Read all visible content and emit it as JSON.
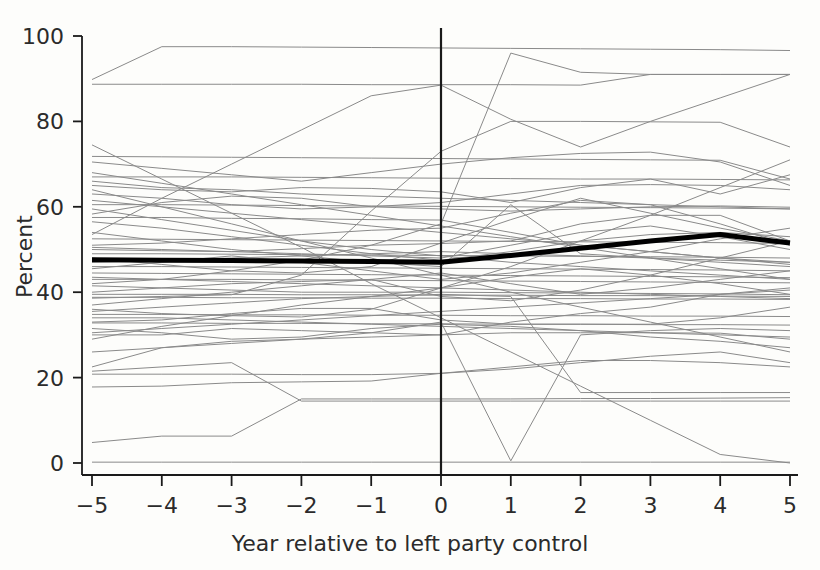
{
  "chart_data": {
    "type": "line",
    "title": "",
    "xlabel": "Year relative to left party control",
    "ylabel": "Percent",
    "xlim": [
      -5,
      5
    ],
    "ylim": [
      0,
      100
    ],
    "x": [
      -5,
      -4,
      -3,
      -2,
      -1,
      0,
      1,
      2,
      3,
      4,
      5
    ],
    "xticks": [
      -5,
      -4,
      -3,
      -2,
      -1,
      0,
      1,
      2,
      3,
      4,
      5
    ],
    "xtick_labels": [
      "−5",
      "−4",
      "−3",
      "−2",
      "−1",
      "0",
      "1",
      "2",
      "3",
      "4",
      "5"
    ],
    "yticks": [
      0,
      20,
      40,
      60,
      80,
      100
    ],
    "ytick_labels": [
      "0",
      "20",
      "40",
      "60",
      "80",
      "100"
    ],
    "grid": false,
    "legend": "none",
    "reference_line": {
      "orientation": "vertical",
      "x": 0,
      "label": "year of left party control",
      "color": "#1a1a1a"
    },
    "highlight_series": {
      "name": "Mean",
      "color": "#000000",
      "linewidth": 5,
      "values": [
        47.6,
        47.5,
        47.4,
        47.3,
        47.2,
        47.0,
        48.6,
        50.3,
        52.0,
        53.5,
        51.5
      ]
    },
    "series_color": "#8a8a8a",
    "series_linewidth": 1,
    "series": [
      {
        "name": "unit-01",
        "values": [
          89.8,
          97.5,
          97.5,
          97.4,
          97.3,
          97.2,
          97.1,
          97.0,
          96.9,
          96.8,
          96.6
        ]
      },
      {
        "name": "unit-02",
        "values": [
          88.7,
          88.7,
          88.7,
          88.7,
          88.6,
          88.6,
          88.6,
          88.5,
          91.0,
          91.0,
          91.0
        ]
      },
      {
        "name": "unit-03",
        "values": [
          53.5,
          62.0,
          70.0,
          78.0,
          86.0,
          88.5,
          80.5,
          74.0,
          80.0,
          85.5,
          91.0
        ]
      },
      {
        "name": "unit-04",
        "values": [
          38.6,
          39.0,
          39.4,
          44.0,
          59.0,
          73.0,
          80.0,
          80.0,
          79.9,
          79.8,
          74.0
        ]
      },
      {
        "name": "unit-05",
        "values": [
          71.8,
          71.7,
          71.6,
          71.5,
          71.4,
          71.3,
          71.2,
          71.1,
          71.0,
          70.9,
          66.5
        ]
      },
      {
        "name": "unit-06",
        "values": [
          70.5,
          69.0,
          67.5,
          66.0,
          68.0,
          70.0,
          71.5,
          72.5,
          72.8,
          70.5,
          65.0
        ]
      },
      {
        "name": "unit-07",
        "values": [
          67.0,
          67.0,
          67.0,
          66.9,
          66.8,
          66.7,
          66.6,
          66.5,
          66.5,
          66.4,
          66.3
        ]
      },
      {
        "name": "unit-08",
        "values": [
          65.0,
          64.0,
          63.5,
          64.5,
          64.3,
          63.5,
          61.0,
          64.5,
          66.5,
          63.0,
          67.5
        ]
      },
      {
        "name": "unit-09",
        "values": [
          63.0,
          62.0,
          60.5,
          59.5,
          60.0,
          61.0,
          63.0,
          65.0,
          65.2,
          65.0,
          64.0
        ]
      },
      {
        "name": "unit-10",
        "values": [
          60.5,
          60.5,
          60.4,
          60.3,
          60.2,
          60.1,
          60.0,
          59.9,
          59.8,
          59.7,
          59.5
        ]
      },
      {
        "name": "unit-11",
        "values": [
          58.3,
          61.0,
          62.5,
          62.0,
          60.0,
          59.5,
          59.0,
          59.5,
          60.0,
          60.2,
          59.9
        ]
      },
      {
        "name": "unit-12",
        "values": [
          52.5,
          52.4,
          52.3,
          52.2,
          52.1,
          52.0,
          51.9,
          51.8,
          51.7,
          51.6,
          51.4
        ]
      },
      {
        "name": "unit-13",
        "values": [
          50.0,
          49.7,
          49.5,
          50.2,
          51.0,
          51.4,
          52.0,
          56.0,
          58.0,
          58.0,
          52.0
        ]
      },
      {
        "name": "unit-14",
        "values": [
          49.0,
          49.0,
          48.9,
          48.8,
          48.7,
          48.6,
          48.5,
          48.4,
          48.3,
          48.2,
          48.0
        ]
      },
      {
        "name": "unit-15",
        "values": [
          46.0,
          46.0,
          45.9,
          45.8,
          45.7,
          45.6,
          45.5,
          45.4,
          45.3,
          45.2,
          45.0
        ]
      },
      {
        "name": "unit-16",
        "values": [
          44.5,
          44.4,
          44.3,
          44.2,
          44.1,
          44.0,
          43.9,
          43.8,
          43.7,
          43.6,
          43.4
        ]
      },
      {
        "name": "unit-17",
        "values": [
          43.0,
          43.0,
          43.0,
          42.9,
          42.8,
          42.7,
          42.6,
          42.5,
          42.4,
          42.3,
          42.2
        ]
      },
      {
        "name": "unit-18",
        "values": [
          41.5,
          41.0,
          40.5,
          40.0,
          40.0,
          40.0,
          39.9,
          39.8,
          39.7,
          39.6,
          39.4
        ]
      },
      {
        "name": "unit-19",
        "values": [
          39.5,
          39.5,
          39.5,
          39.4,
          39.4,
          39.3,
          39.3,
          39.2,
          39.2,
          39.1,
          39.0
        ]
      },
      {
        "name": "unit-20",
        "values": [
          38.8,
          38.8,
          38.7,
          38.7,
          38.6,
          38.6,
          38.5,
          38.5,
          38.4,
          38.4,
          38.3
        ]
      },
      {
        "name": "unit-21",
        "values": [
          34.8,
          34.8,
          34.7,
          34.7,
          34.6,
          34.6,
          34.5,
          34.5,
          34.4,
          34.4,
          34.3
        ]
      },
      {
        "name": "unit-22",
        "values": [
          33.0,
          33.5,
          35.0,
          36.2,
          36.2,
          33.5,
          32.5,
          32.5,
          32.5,
          34.0,
          36.5
        ]
      },
      {
        "name": "unit-23",
        "values": [
          32.8,
          32.8,
          32.7,
          32.7,
          32.6,
          32.6,
          32.5,
          32.5,
          32.4,
          32.4,
          32.3
        ]
      },
      {
        "name": "unit-24",
        "values": [
          31.5,
          30.5,
          29.0,
          29.5,
          31.5,
          32.5,
          32.0,
          31.0,
          29.5,
          28.5,
          27.0
        ]
      },
      {
        "name": "unit-25",
        "values": [
          30.0,
          30.0,
          31.5,
          31.0,
          30.5,
          30.0,
          30.5,
          30.5,
          30.5,
          30.4,
          29.0
        ]
      },
      {
        "name": "unit-26",
        "values": [
          22.5,
          27.0,
          28.5,
          29.0,
          29.5,
          30.0,
          33.0,
          35.0,
          36.5,
          39.5,
          41.0
        ]
      },
      {
        "name": "unit-27",
        "values": [
          20.8,
          20.8,
          20.8,
          20.7,
          20.7,
          21.0,
          22.0,
          23.5,
          25.0,
          26.0,
          23.5
        ]
      },
      {
        "name": "unit-28",
        "values": [
          17.8,
          18.0,
          18.8,
          19.0,
          19.2,
          21.0,
          22.5,
          24.0,
          24.0,
          23.5,
          22.5
        ]
      },
      {
        "name": "unit-29",
        "values": [
          4.8,
          6.3,
          6.3,
          15.0,
          15.0,
          15.0,
          15.0,
          15.1,
          15.1,
          15.2,
          15.3
        ]
      },
      {
        "name": "unit-30",
        "values": [
          0.2,
          0.2,
          0.2,
          0.2,
          0.2,
          0.2,
          0.2,
          0.2,
          0.2,
          0.2,
          0.2
        ]
      },
      {
        "name": "unit-31",
        "values": [
          74.5,
          66.5,
          58.5,
          50.5,
          42.0,
          34.0,
          26.0,
          18.0,
          10.0,
          2.0,
          0.0
        ]
      },
      {
        "name": "unit-32",
        "values": [
          42.0,
          43.0,
          45.0,
          47.5,
          51.0,
          56.0,
          96.0,
          91.5,
          91.0,
          91.0,
          91.0
        ]
      },
      {
        "name": "unit-33",
        "values": [
          36.0,
          35.0,
          34.5,
          34.2,
          36.0,
          41.0,
          46.0,
          52.0,
          58.0,
          64.5,
          71.0
        ]
      },
      {
        "name": "unit-34",
        "values": [
          64.0,
          60.0,
          56.0,
          52.0,
          48.0,
          44.0,
          40.0,
          36.5,
          33.0,
          29.5,
          26.0
        ]
      },
      {
        "name": "unit-35",
        "values": [
          51.0,
          51.5,
          52.5,
          53.5,
          54.5,
          55.0,
          58.5,
          61.5,
          60.5,
          56.0,
          51.0
        ]
      },
      {
        "name": "unit-36",
        "values": [
          59.5,
          57.0,
          54.5,
          52.0,
          50.0,
          48.5,
          47.0,
          46.0,
          45.0,
          44.0,
          43.0
        ]
      },
      {
        "name": "unit-37",
        "values": [
          48.0,
          46.5,
          45.0,
          44.5,
          46.0,
          51.5,
          57.0,
          62.0,
          58.5,
          55.0,
          52.0
        ]
      },
      {
        "name": "unit-38",
        "values": [
          56.5,
          55.0,
          53.0,
          51.0,
          49.0,
          47.5,
          49.5,
          52.0,
          53.5,
          54.0,
          53.0
        ]
      },
      {
        "name": "unit-39",
        "values": [
          45.5,
          47.0,
          48.5,
          47.0,
          45.0,
          43.0,
          44.5,
          47.0,
          49.5,
          52.5,
          55.0
        ]
      },
      {
        "name": "unit-40",
        "values": [
          37.0,
          38.5,
          40.0,
          41.5,
          43.0,
          44.5,
          42.0,
          39.5,
          41.0,
          43.0,
          45.0
        ]
      },
      {
        "name": "unit-41",
        "values": [
          29.0,
          32.0,
          34.5,
          37.0,
          39.0,
          41.0,
          43.5,
          45.5,
          44.0,
          42.0,
          39.5
        ]
      },
      {
        "name": "unit-42",
        "values": [
          54.0,
          52.0,
          50.0,
          48.5,
          47.0,
          46.0,
          60.5,
          49.0,
          48.0,
          47.0,
          46.0
        ]
      },
      {
        "name": "unit-43",
        "values": [
          57.5,
          57.5,
          57.3,
          57.2,
          57.0,
          56.9,
          54.0,
          51.0,
          49.5,
          48.0,
          47.0
        ]
      },
      {
        "name": "unit-44",
        "values": [
          68.0,
          65.5,
          63.0,
          60.5,
          58.0,
          55.5,
          53.0,
          50.5,
          48.0,
          45.5,
          43.0
        ]
      },
      {
        "name": "unit-45",
        "values": [
          40.0,
          41.0,
          42.0,
          42.5,
          43.0,
          39.0,
          38.0,
          40.5,
          44.0,
          48.0,
          52.0
        ]
      },
      {
        "name": "unit-46",
        "values": [
          26.0,
          27.0,
          28.0,
          29.0,
          30.5,
          33.0,
          0.5,
          30.0,
          31.0,
          31.5,
          31.0
        ]
      },
      {
        "name": "unit-47",
        "values": [
          35.5,
          36.5,
          37.5,
          38.5,
          39.0,
          39.5,
          39.0,
          16.5,
          16.5,
          16.5,
          16.5
        ]
      },
      {
        "name": "unit-48",
        "values": [
          43.5,
          43.0,
          42.5,
          42.0,
          41.5,
          41.0,
          40.5,
          40.0,
          39.5,
          39.0,
          38.5
        ]
      },
      {
        "name": "unit-49",
        "values": [
          61.5,
          60.0,
          58.5,
          57.0,
          55.5,
          54.0,
          52.5,
          51.0,
          49.5,
          48.0,
          46.5
        ]
      },
      {
        "name": "unit-50",
        "values": [
          30.5,
          31.5,
          32.5,
          33.5,
          34.5,
          35.5,
          36.5,
          37.5,
          38.5,
          39.5,
          40.5
        ]
      },
      {
        "name": "unit-51",
        "values": [
          50.5,
          50.0,
          49.5,
          49.0,
          48.5,
          48.0,
          51.0,
          54.0,
          55.5,
          53.0,
          50.0
        ]
      },
      {
        "name": "unit-52",
        "values": [
          66.0,
          64.5,
          64.0,
          63.0,
          62.5,
          62.0,
          61.5,
          61.0,
          60.5,
          60.0,
          59.5
        ]
      },
      {
        "name": "unit-53",
        "values": [
          47.0,
          47.5,
          48.0,
          48.5,
          49.0,
          49.5,
          49.0,
          48.5,
          48.0,
          47.5,
          47.0
        ]
      },
      {
        "name": "unit-54",
        "values": [
          21.5,
          22.5,
          23.5,
          14.5,
          14.5,
          14.5,
          14.5,
          14.5,
          14.5,
          14.5,
          14.5
        ]
      },
      {
        "name": "unit-55",
        "values": [
          34.0,
          34.0,
          33.5,
          33.0,
          32.5,
          32.0,
          31.5,
          31.0,
          30.5,
          30.0,
          29.5
        ]
      }
    ]
  },
  "axis": {
    "y_label": "Percent",
    "x_label": "Year relative to left party control"
  }
}
